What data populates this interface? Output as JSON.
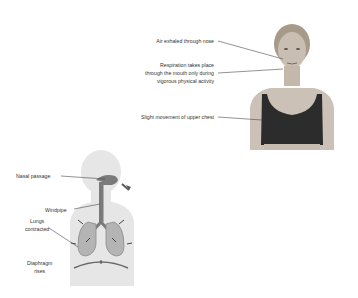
{
  "photo_figure": {
    "labels": [
      {
        "text": "Air exhaled through nose"
      },
      {
        "line1": "Respiration takes place",
        "line2": "through the mouth only during",
        "line3": "vigorous physical activity"
      },
      {
        "text": "Slight movement of upper chest"
      }
    ]
  },
  "diagram_figure": {
    "labels": [
      {
        "text": "Nasal passage"
      },
      {
        "text": "Windpipe"
      },
      {
        "line1": "Lungs",
        "line2": "contracted"
      },
      {
        "line1": "Diaphragm",
        "line2": "rises"
      }
    ]
  }
}
